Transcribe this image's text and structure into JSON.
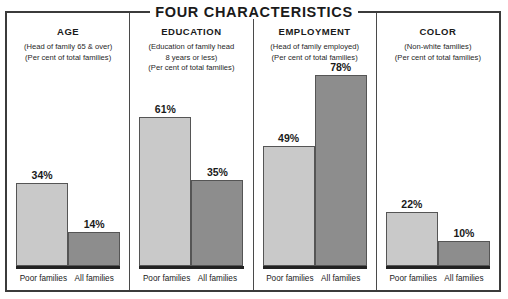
{
  "chart_title": "FOUR CHARACTERISTICS",
  "series_labels": {
    "poor": "Poor families",
    "all": "All families"
  },
  "colors": {
    "poor_bar": "#c9c9c9",
    "all_bar": "#8d8d8d",
    "frame": "#3b3b3b",
    "baseline": "#222222",
    "text": "#1a1a1a"
  },
  "panels": [
    {
      "name": "AGE",
      "sub_lines": [
        "(Head of family 65 & over)",
        "(Per cent of total families)"
      ],
      "poor_label": "Poor families",
      "all_label": "All families",
      "poor_value_text": "34%",
      "all_value_text": "14%"
    },
    {
      "name": "EDUCATION",
      "sub_lines": [
        "(Education of family head",
        "8 years or less)",
        "(Per cent of total families)"
      ],
      "poor_label": "Poor families",
      "all_label": "All families",
      "poor_value_text": "61%",
      "all_value_text": "35%"
    },
    {
      "name": "EMPLOYMENT",
      "sub_lines": [
        "(Head of family employed)",
        "(Per cent of total families)"
      ],
      "poor_label": "Poor families",
      "all_label": "All families",
      "poor_value_text": "49%",
      "all_value_text": "78%"
    },
    {
      "name": "COLOR",
      "sub_lines": [
        "(Non-white families)",
        "(Per cent of total families)"
      ],
      "poor_label": "Poor families",
      "all_label": "All families",
      "poor_value_text": "22%",
      "all_value_text": "10%"
    }
  ],
  "chart_data": {
    "type": "bar",
    "title": "FOUR CHARACTERISTICS",
    "xlabel": "",
    "ylabel": "Per cent of total families",
    "ylim": [
      0,
      80
    ],
    "grid": false,
    "legend_position": "none",
    "categories": [
      "AGE",
      "EDUCATION",
      "EMPLOYMENT",
      "COLOR"
    ],
    "category_notes": [
      "Head of family 65 & over; Per cent of total families",
      "Education of family head 8 years or less; Per cent of total families",
      "Head of family employed; Per cent of total families",
      "Non-white families; Per cent of total families"
    ],
    "series": [
      {
        "name": "Poor families",
        "color": "#c9c9c9",
        "values": [
          34,
          61,
          49,
          22
        ]
      },
      {
        "name": "All families",
        "color": "#8d8d8d",
        "values": [
          14,
          35,
          78,
          10
        ]
      }
    ],
    "data_labels": [
      "34%",
      "14%",
      "61%",
      "35%",
      "49%",
      "78%",
      "22%",
      "10%"
    ],
    "units": "percent"
  }
}
